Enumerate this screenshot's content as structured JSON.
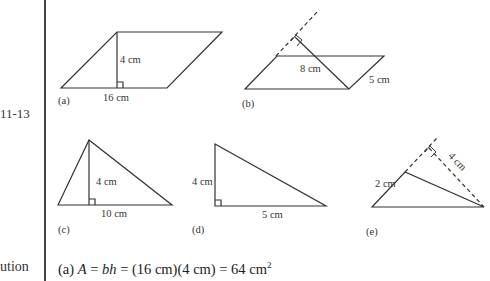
{
  "margin": {
    "figure_label": "11-13",
    "solution_label": "ution"
  },
  "figures": {
    "a": {
      "label": "(a)",
      "height": "4 cm",
      "base": "16 cm"
    },
    "b": {
      "label": "(b)",
      "height": "8 cm",
      "side": "5 cm"
    },
    "c": {
      "label": "(c)",
      "height": "4 cm",
      "base": "10 cm"
    },
    "d": {
      "label": "(d)",
      "height": "4 cm",
      "base": "5 cm"
    },
    "e": {
      "label": "(e)",
      "side": "2 cm",
      "height": "4 cm"
    }
  },
  "solution": {
    "part": "(a)",
    "var": "A",
    "eq1": " = ",
    "formula": "bh",
    "eq2": " = (16 cm)(4 cm) = 64 cm",
    "exp": "2"
  }
}
